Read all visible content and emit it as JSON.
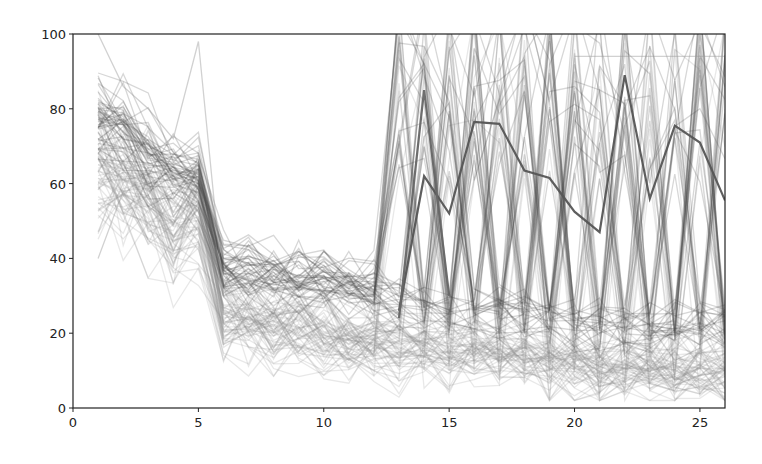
{
  "chart_data": {
    "type": "line",
    "title": "",
    "xlabel": "",
    "ylabel": "",
    "xlim": [
      0,
      26
    ],
    "ylim": [
      0,
      100
    ],
    "grid": false,
    "legend": null,
    "x_ticks": [
      0,
      5,
      10,
      15,
      20,
      25
    ],
    "y_ticks": [
      0,
      20,
      40,
      60,
      80,
      100
    ],
    "x": [
      1,
      2,
      3,
      4,
      5,
      6,
      7,
      8,
      9,
      10,
      11,
      12,
      13,
      14,
      15,
      16,
      17,
      18,
      19,
      20,
      21,
      22,
      23,
      24,
      25,
      26
    ],
    "highlighted_series": [
      {
        "name": "dark-highlight-1",
        "color": "#555555",
        "x": [
          13,
          14,
          15,
          16,
          17,
          18,
          19,
          20,
          21,
          22,
          23,
          24,
          25,
          26
        ],
        "values": [
          26,
          62,
          52,
          76.5,
          76,
          63.5,
          61.5,
          52.5,
          47,
          89,
          56,
          75.5,
          71,
          55.5
        ]
      },
      {
        "name": "dark-highlight-2",
        "color": "#666666",
        "x": [
          13,
          14,
          15
        ],
        "values": [
          24,
          85,
          30
        ]
      }
    ],
    "bands": [
      {
        "name": "dark-cluster",
        "color": "#4a4a4a",
        "opacity": 0.22,
        "count": 45,
        "mean": [
          78,
          74,
          66,
          63,
          61,
          38,
          37,
          36,
          35,
          35,
          33,
          31,
          28,
          27,
          26,
          26,
          25,
          25,
          24,
          23,
          23,
          22,
          22,
          22,
          22,
          22
        ],
        "spread": [
          5,
          5,
          5,
          4,
          4,
          4,
          4,
          4,
          4,
          3,
          3,
          3,
          3,
          3,
          3,
          3,
          3,
          3,
          3,
          3,
          3,
          3,
          3,
          3,
          3,
          3
        ],
        "spike_from": 13,
        "spike_prob": 0.35
      },
      {
        "name": "light-cluster",
        "color": "#8c8c8c",
        "opacity": 0.2,
        "count": 70,
        "mean": [
          66,
          60,
          55,
          50,
          53,
          26,
          24,
          22,
          22,
          21,
          19,
          18,
          17,
          17,
          16,
          16,
          15,
          15,
          12,
          12,
          11,
          11,
          11,
          11,
          11,
          10
        ],
        "spread": [
          8,
          7,
          7,
          7,
          7,
          5,
          5,
          5,
          5,
          5,
          5,
          4,
          4,
          4,
          4,
          4,
          4,
          4,
          4,
          4,
          4,
          4,
          4,
          4,
          4,
          4
        ],
        "spike_from": 13,
        "spike_prob": 0.12
      }
    ],
    "outliers": [
      {
        "x": [
          1,
          2,
          3,
          4,
          5,
          6
        ],
        "values": [
          100,
          86,
          80,
          72,
          98,
          30
        ]
      },
      {
        "x": [
          1,
          2,
          3
        ],
        "values": [
          40,
          58,
          45
        ]
      },
      {
        "x": [
          20,
          21,
          22,
          23,
          24,
          25,
          26
        ],
        "values": [
          94,
          94,
          94,
          94,
          94,
          94,
          94
        ]
      }
    ]
  },
  "axes": {
    "x_tick_labels": [
      "0",
      "5",
      "10",
      "15",
      "20",
      "25"
    ],
    "y_tick_labels": [
      "0",
      "20",
      "40",
      "60",
      "80",
      "100"
    ]
  },
  "layout": {
    "plot_left": 73,
    "plot_right": 725,
    "plot_top": 34,
    "plot_bottom": 408
  }
}
